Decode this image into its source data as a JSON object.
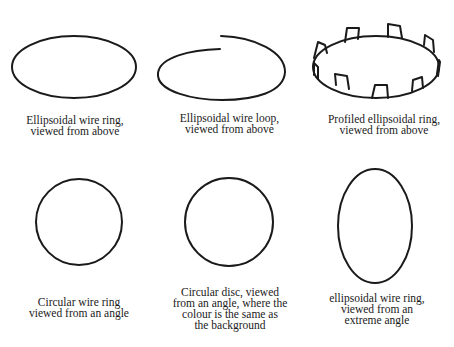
{
  "figure": {
    "stroke_color": "#1a1a1a",
    "background": "#ffffff",
    "panels": [
      {
        "id": "ellipsoidal-wire-ring-above",
        "caption_lines": [
          "Ellipsoidal wire ring,",
          "viewed from above"
        ]
      },
      {
        "id": "ellipsoidal-wire-loop-above",
        "caption_lines": [
          "Ellipsoidal wire loop,",
          "viewed from above"
        ]
      },
      {
        "id": "profiled-ellipsoidal-ring-above",
        "caption_lines": [
          "Profiled ellipsoidal ring,",
          "viewed from above"
        ]
      },
      {
        "id": "circular-wire-ring-angle",
        "caption_lines": [
          "Circular wire ring",
          "viewed from an angle"
        ]
      },
      {
        "id": "circular-disc-angle",
        "caption_lines": [
          "Circular disc, viewed",
          "from an angle, where the",
          "colour is the same as",
          "the background"
        ]
      },
      {
        "id": "ellipsoidal-wire-ring-extreme",
        "caption_lines": [
          "ellipsoidal wire ring,",
          "viewed from an",
          "extreme angle"
        ]
      }
    ]
  }
}
